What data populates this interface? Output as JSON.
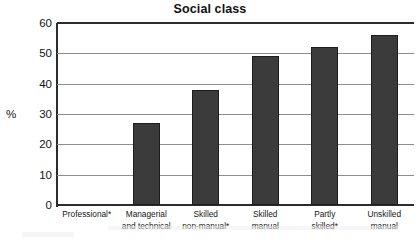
{
  "chart_data": {
    "type": "bar",
    "title": "Social class",
    "xlabel": "",
    "ylabel": "%",
    "categories": [
      "Professional*",
      "Managerial and technical",
      "Skilled non-manual*",
      "Skilled manual",
      "Partly skilled*",
      "Unskilled manual"
    ],
    "category_lines": [
      [
        "Professional*",
        ""
      ],
      [
        "Managerial",
        "and technical"
      ],
      [
        "Skilled",
        "non-manual*"
      ],
      [
        "Skilled",
        "manual"
      ],
      [
        "Partly",
        "skilled*"
      ],
      [
        "Unskilled",
        "manual"
      ]
    ],
    "values": [
      null,
      27,
      38,
      49,
      52,
      56
    ],
    "ylim": [
      0,
      60
    ],
    "yticks": [
      0,
      10,
      20,
      30,
      40,
      50,
      60
    ],
    "ytick_labels": [
      "0",
      "10",
      "20",
      "30",
      "40",
      "50",
      "60"
    ],
    "grid": true,
    "legend": false,
    "bar_color": "#3b3b3b",
    "bar_edge_color": "#1d1d1d",
    "axis_color": "#2c2c2c",
    "gridline_color": "#8d8d8d",
    "background_color": "#ffffff",
    "text_color": "#141414"
  }
}
